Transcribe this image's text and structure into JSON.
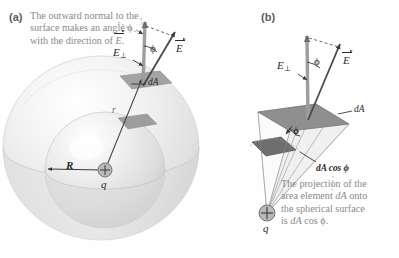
{
  "figure": {
    "background_color": "#fefefe",
    "caption_color": "#8a8a8a",
    "label_color": "#2a2a2a",
    "sphere_color": "#e9e9e9",
    "area_element_color": "#9a9a9a"
  },
  "panel_a": {
    "letter": "(a)",
    "caption_line1": "The outward normal to the",
    "caption_line2": "surface makes an angle ϕ",
    "caption_line3_pre": "with the direction of ",
    "caption_line3_vec": "E",
    "caption_line3_post": ".",
    "labels": {
      "e_perp_symbol": "E",
      "e_perp_sub": "⊥",
      "phi": "ϕ",
      "e_vector": "E",
      "area_element": "dA",
      "radius_outer": "r",
      "radius_inner": "R",
      "charge": "q",
      "charge_sign": "+"
    }
  },
  "panel_b": {
    "letter": "(b)",
    "labels": {
      "e_perp_symbol": "E",
      "e_perp_sub": "⊥",
      "phi": "ϕ",
      "phi_solid": "ϕ",
      "e_vector": "E",
      "area_element": "dA",
      "projection": "dA cos ϕ",
      "charge": "q",
      "charge_sign": "+"
    },
    "caption_line1": "The projection of the",
    "caption_line2_pre": "area element ",
    "caption_line2_it": "dA",
    "caption_line2_post": " onto",
    "caption_line3": "the spherical surface",
    "caption_line4_pre": "is ",
    "caption_line4_it": "dA",
    "caption_line4_post": " cos ϕ."
  }
}
